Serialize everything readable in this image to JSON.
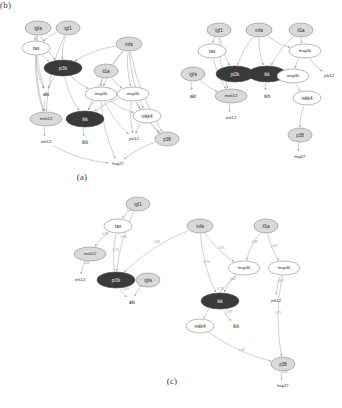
{
  "figure": {
    "kind": "signaling-network-figure",
    "panels": [
      {
        "id": "a",
        "caption": "(a)"
      },
      {
        "id": "b",
        "caption": "(b)"
      },
      {
        "id": "c",
        "caption": "(c)"
      }
    ]
  },
  "styles": {
    "stimulus_fill": "#d9d9d9",
    "dark_fill": "#3a3a3a",
    "dark_fill_alt": "#4d4d4d",
    "white_fill": "#ffffff",
    "stroke": "#8a8a8a",
    "edge": "#a8a8a8",
    "text_dark": "#2a2a2a",
    "text_light": "#f2f2f2"
  },
  "panel_a": {
    "caption": "(a)",
    "nodes": [
      {
        "id": "igfa",
        "label": "igfa",
        "x": 32,
        "y": 22,
        "rx": 13,
        "ry": 7,
        "shape": "ellipse",
        "fill": "stimulus",
        "text": "dark"
      },
      {
        "id": "igf1",
        "label": "igf1",
        "x": 62,
        "y": 22,
        "rx": 12,
        "ry": 7,
        "shape": "ellipse",
        "fill": "stimulus",
        "text": "dark"
      },
      {
        "id": "ras",
        "label": "ras",
        "x": 30,
        "y": 42,
        "rx": 14,
        "ry": 7,
        "shape": "ellipse",
        "fill": "white",
        "text": "dark"
      },
      {
        "id": "tnfa",
        "label": "tnfa",
        "x": 123,
        "y": 38,
        "rx": 13,
        "ry": 7,
        "shape": "ellipse",
        "fill": "stimulus",
        "text": "dark"
      },
      {
        "id": "pi3k",
        "label": "pi3k",
        "x": 57,
        "y": 62,
        "rx": 19,
        "ry": 8,
        "shape": "ellipse",
        "fill": "dark",
        "text": "light"
      },
      {
        "id": "il1a",
        "label": "il1a",
        "x": 100,
        "y": 65,
        "rx": 12,
        "ry": 7,
        "shape": "ellipse",
        "fill": "stimulus",
        "text": "dark"
      },
      {
        "id": "akt",
        "label": "akt",
        "x": 40,
        "y": 88,
        "rx": 0,
        "ry": 0,
        "shape": "text",
        "fill": "none",
        "text": "dark"
      },
      {
        "id": "map3k1",
        "label": "map3k",
        "x": 95,
        "y": 88,
        "rx": 16,
        "ry": 7,
        "shape": "ellipse",
        "fill": "white",
        "text": "dark"
      },
      {
        "id": "map3k2",
        "label": "map3k",
        "x": 127,
        "y": 88,
        "rx": 16,
        "ry": 7,
        "shape": "ellipse",
        "fill": "white",
        "text": "dark"
      },
      {
        "id": "mek12",
        "label": "mek12",
        "x": 40,
        "y": 113,
        "rx": 16,
        "ry": 7,
        "shape": "ellipse",
        "fill": "stimulus",
        "text": "dark"
      },
      {
        "id": "ikk",
        "label": "ikk",
        "x": 79,
        "y": 113,
        "rx": 19,
        "ry": 8,
        "shape": "ellipse",
        "fill": "dark",
        "text": "light"
      },
      {
        "id": "mkk4",
        "label": "mkk4",
        "x": 141,
        "y": 110,
        "rx": 14,
        "ry": 7,
        "shape": "ellipse",
        "fill": "white",
        "text": "dark"
      },
      {
        "id": "erk12",
        "label": "erk12",
        "x": 40,
        "y": 136,
        "rx": 0,
        "ry": 0,
        "shape": "text",
        "fill": "none",
        "text": "dark"
      },
      {
        "id": "ikb",
        "label": "ikb",
        "x": 79,
        "y": 136,
        "rx": 0,
        "ry": 0,
        "shape": "text",
        "fill": "none",
        "text": "dark"
      },
      {
        "id": "jnk12",
        "label": "jnk12",
        "x": 128,
        "y": 133,
        "rx": 0,
        "ry": 0,
        "shape": "text",
        "fill": "none",
        "text": "dark"
      },
      {
        "id": "p38",
        "label": "p38",
        "x": 161,
        "y": 133,
        "rx": 12,
        "ry": 7,
        "shape": "ellipse",
        "fill": "stimulus",
        "text": "dark"
      },
      {
        "id": "hsp27",
        "label": "hsp27",
        "x": 112,
        "y": 158,
        "rx": 0,
        "ry": 0,
        "shape": "text",
        "fill": "none",
        "text": "dark"
      }
    ],
    "edges": [
      {
        "from": "igfa",
        "to": "ras"
      },
      {
        "from": "igf1",
        "to": "ras"
      },
      {
        "from": "igfa",
        "to": "pi3k"
      },
      {
        "from": "igf1",
        "to": "pi3k"
      },
      {
        "from": "ras",
        "to": "pi3k"
      },
      {
        "from": "ras",
        "to": "mek12"
      },
      {
        "from": "ras",
        "to": "akt"
      },
      {
        "from": "igfa",
        "to": "akt"
      },
      {
        "from": "igfa",
        "to": "mek12"
      },
      {
        "from": "igf1",
        "to": "mek12"
      },
      {
        "from": "tnfa",
        "to": "pi3k"
      },
      {
        "from": "tnfa",
        "to": "map3k1"
      },
      {
        "from": "tnfa",
        "to": "map3k2"
      },
      {
        "from": "tnfa",
        "to": "ikk"
      },
      {
        "from": "tnfa",
        "to": "mkk4"
      },
      {
        "from": "tnfa",
        "to": "p38"
      },
      {
        "from": "il1a",
        "to": "map3k1"
      },
      {
        "from": "il1a",
        "to": "map3k2"
      },
      {
        "from": "pi3k",
        "to": "akt"
      },
      {
        "from": "pi3k",
        "to": "ikk"
      },
      {
        "from": "pi3k",
        "to": "map3k1"
      },
      {
        "from": "akt",
        "to": "mek12"
      },
      {
        "from": "map3k1",
        "to": "ikk"
      },
      {
        "from": "map3k1",
        "to": "mkk4"
      },
      {
        "from": "map3k1",
        "to": "jnk12"
      },
      {
        "from": "map3k1",
        "to": "hsp27"
      },
      {
        "from": "map3k2",
        "to": "mkk4"
      },
      {
        "from": "map3k2",
        "to": "jnk12"
      },
      {
        "from": "map3k2",
        "to": "p38"
      },
      {
        "from": "map3k2",
        "to": "ikk"
      },
      {
        "from": "mkk4",
        "to": "jnk12"
      },
      {
        "from": "mkk4",
        "to": "p38"
      },
      {
        "from": "mek12",
        "to": "erk12"
      },
      {
        "from": "ikk",
        "to": "ikb"
      },
      {
        "from": "erk12",
        "to": "hsp27"
      },
      {
        "from": "p38",
        "to": "hsp27"
      }
    ]
  },
  "panel_b": {
    "caption": "(b)",
    "nodes": [
      {
        "id": "igf1",
        "label": "igf1",
        "x": 36,
        "y": 24,
        "rx": 12,
        "ry": 7,
        "shape": "ellipse",
        "fill": "stimulus",
        "text": "dark"
      },
      {
        "id": "tnfa",
        "label": "tnfa",
        "x": 76,
        "y": 24,
        "rx": 13,
        "ry": 7,
        "shape": "ellipse",
        "fill": "stimulus",
        "text": "dark"
      },
      {
        "id": "il1a",
        "label": "il1a",
        "x": 118,
        "y": 24,
        "rx": 12,
        "ry": 7,
        "shape": "ellipse",
        "fill": "stimulus",
        "text": "dark"
      },
      {
        "id": "ras",
        "label": "ras",
        "x": 29,
        "y": 45,
        "rx": 14,
        "ry": 7,
        "shape": "ellipse",
        "fill": "white",
        "text": "dark"
      },
      {
        "id": "map3k1",
        "label": "map3k",
        "x": 122,
        "y": 45,
        "rx": 16,
        "ry": 7,
        "shape": "ellipse",
        "fill": "white",
        "text": "dark"
      },
      {
        "id": "igfa",
        "label": "igfa",
        "x": 10,
        "y": 68,
        "rx": 12,
        "ry": 7,
        "shape": "ellipse",
        "fill": "stimulus",
        "text": "dark"
      },
      {
        "id": "pi3k",
        "label": "pi3k",
        "x": 52,
        "y": 68,
        "rx": 19,
        "ry": 8,
        "shape": "ellipse",
        "fill": "dark",
        "text": "light"
      },
      {
        "id": "ikk",
        "label": "ikk",
        "x": 84,
        "y": 68,
        "rx": 19,
        "ry": 8,
        "shape": "ellipse",
        "fill": "dark",
        "text": "light"
      },
      {
        "id": "map3k2",
        "label": "map3k",
        "x": 110,
        "y": 70,
        "rx": 16,
        "ry": 7,
        "shape": "ellipse",
        "fill": "white",
        "text": "dark"
      },
      {
        "id": "jnk12",
        "label": "jnk12",
        "x": 146,
        "y": 70,
        "rx": 0,
        "ry": 0,
        "shape": "text",
        "fill": "none",
        "text": "dark"
      },
      {
        "id": "akt",
        "label": "akt",
        "x": 10,
        "y": 90,
        "rx": 0,
        "ry": 0,
        "shape": "text",
        "fill": "none",
        "text": "dark"
      },
      {
        "id": "mek12",
        "label": "mek12",
        "x": 48,
        "y": 90,
        "rx": 16,
        "ry": 7,
        "shape": "ellipse",
        "fill": "stimulus",
        "text": "dark"
      },
      {
        "id": "ikb",
        "label": "ikb",
        "x": 84,
        "y": 90,
        "rx": 0,
        "ry": 0,
        "shape": "text",
        "fill": "none",
        "text": "dark"
      },
      {
        "id": "mkk4",
        "label": "mkk4",
        "x": 124,
        "y": 92,
        "rx": 14,
        "ry": 7,
        "shape": "ellipse",
        "fill": "white",
        "text": "dark"
      },
      {
        "id": "erk12",
        "label": "erk12",
        "x": 48,
        "y": 112,
        "rx": 0,
        "ry": 0,
        "shape": "text",
        "fill": "none",
        "text": "dark"
      },
      {
        "id": "p38",
        "label": "p38",
        "x": 117,
        "y": 129,
        "rx": 12,
        "ry": 7,
        "shape": "ellipse",
        "fill": "stimulus",
        "text": "dark"
      },
      {
        "id": "hsp27",
        "label": "hsp27",
        "x": 117,
        "y": 151,
        "rx": 0,
        "ry": 0,
        "shape": "text",
        "fill": "none",
        "text": "dark"
      }
    ],
    "edges": [
      {
        "from": "igf1",
        "to": "ras"
      },
      {
        "from": "igf1",
        "to": "pi3k"
      },
      {
        "from": "igf1",
        "to": "mek12"
      },
      {
        "from": "ras",
        "to": "mek12"
      },
      {
        "from": "tnfa",
        "to": "pi3k"
      },
      {
        "from": "tnfa",
        "to": "ikk"
      },
      {
        "from": "tnfa",
        "to": "map3k1"
      },
      {
        "from": "il1a",
        "to": "map3k1"
      },
      {
        "from": "il1a",
        "to": "ikk"
      },
      {
        "from": "igfa",
        "to": "akt"
      },
      {
        "from": "igfa",
        "to": "mek12"
      },
      {
        "from": "map3k1",
        "to": "map3k2"
      },
      {
        "from": "map3k1",
        "to": "jnk12"
      },
      {
        "from": "map3k2",
        "to": "mkk4"
      },
      {
        "from": "ikk",
        "to": "ikb"
      },
      {
        "from": "mek12",
        "to": "erk12"
      },
      {
        "from": "mkk4",
        "to": "p38"
      },
      {
        "from": "p38",
        "to": "hsp27"
      }
    ]
  },
  "panel_c": {
    "caption": "(c)",
    "nodes": [
      {
        "id": "igf1",
        "label": "igf1",
        "x": 90,
        "y": 8,
        "rx": 12,
        "ry": 7,
        "shape": "ellipse",
        "fill": "stimulus",
        "text": "dark"
      },
      {
        "id": "ras",
        "label": "ras",
        "x": 70,
        "y": 30,
        "rx": 14,
        "ry": 7,
        "shape": "ellipse",
        "fill": "white",
        "text": "dark"
      },
      {
        "id": "tnfa",
        "label": "tnfa",
        "x": 152,
        "y": 30,
        "rx": 13,
        "ry": 7,
        "shape": "ellipse",
        "fill": "stimulus",
        "text": "dark"
      },
      {
        "id": "il1a",
        "label": "il1a",
        "x": 218,
        "y": 30,
        "rx": 12,
        "ry": 7,
        "shape": "ellipse",
        "fill": "stimulus",
        "text": "dark"
      },
      {
        "id": "mek12",
        "label": "mek12",
        "x": 42,
        "y": 58,
        "rx": 16,
        "ry": 7,
        "shape": "ellipse",
        "fill": "stimulus",
        "text": "dark"
      },
      {
        "id": "map3k1",
        "label": "map3k",
        "x": 196,
        "y": 72,
        "rx": 16,
        "ry": 7,
        "shape": "ellipse",
        "fill": "white",
        "text": "dark"
      },
      {
        "id": "map3k2",
        "label": "map3k",
        "x": 236,
        "y": 72,
        "rx": 16,
        "ry": 7,
        "shape": "ellipse",
        "fill": "white",
        "text": "dark"
      },
      {
        "id": "erk12",
        "label": "erk12",
        "x": 32,
        "y": 84,
        "rx": 0,
        "ry": 0,
        "shape": "text",
        "fill": "none",
        "text": "dark"
      },
      {
        "id": "pi3k",
        "label": "pi3k",
        "x": 68,
        "y": 84,
        "rx": 19,
        "ry": 8,
        "shape": "ellipse",
        "fill": "dark",
        "text": "light"
      },
      {
        "id": "igfa",
        "label": "igfa",
        "x": 100,
        "y": 84,
        "rx": 12,
        "ry": 7,
        "shape": "ellipse",
        "fill": "stimulus",
        "text": "dark"
      },
      {
        "id": "ikk",
        "label": "ikk",
        "x": 172,
        "y": 105,
        "rx": 19,
        "ry": 8,
        "shape": "ellipse",
        "fill": "dark",
        "text": "light"
      },
      {
        "id": "jnk12",
        "label": "jnk12",
        "x": 228,
        "y": 105,
        "rx": 0,
        "ry": 0,
        "shape": "text",
        "fill": "none",
        "text": "dark"
      },
      {
        "id": "akt",
        "label": "akt",
        "x": 84,
        "y": 106,
        "rx": 0,
        "ry": 0,
        "shape": "text",
        "fill": "none",
        "text": "dark"
      },
      {
        "id": "mkk4",
        "label": "mkk4",
        "x": 152,
        "y": 130,
        "rx": 14,
        "ry": 7,
        "shape": "ellipse",
        "fill": "white",
        "text": "dark"
      },
      {
        "id": "ikb",
        "label": "ikb",
        "x": 188,
        "y": 130,
        "rx": 0,
        "ry": 0,
        "shape": "text",
        "fill": "none",
        "text": "dark"
      },
      {
        "id": "p38",
        "label": "p38",
        "x": 235,
        "y": 168,
        "rx": 12,
        "ry": 7,
        "shape": "ellipse",
        "fill": "stimulus",
        "text": "dark"
      },
      {
        "id": "hsp27",
        "label": "hsp27",
        "x": 235,
        "y": 190,
        "rx": 0,
        "ry": 0,
        "shape": "text",
        "fill": "none",
        "text": "dark"
      }
    ],
    "edges": [
      {
        "from": "igf1",
        "to": "ras",
        "label": "1.00"
      },
      {
        "from": "igf1",
        "to": "pi3k",
        "label": "0.98"
      },
      {
        "from": "ras",
        "to": "mek12",
        "label": "0.96"
      },
      {
        "from": "ras",
        "to": "pi3k",
        "label": "0.72"
      },
      {
        "from": "tnfa",
        "to": "pi3k",
        "label": "0.88"
      },
      {
        "from": "tnfa",
        "to": "ikk",
        "label": "0.94"
      },
      {
        "from": "tnfa",
        "to": "map3k1",
        "label": "0.91"
      },
      {
        "from": "il1a",
        "to": "map3k1",
        "label": "0.99"
      },
      {
        "from": "il1a",
        "to": "map3k2",
        "label": "0.87"
      },
      {
        "from": "map3k1",
        "to": "ikk",
        "label": "0.64"
      },
      {
        "from": "map3k1",
        "to": "mkk4",
        "label": "0.78"
      },
      {
        "from": "map3k2",
        "to": "jnk12",
        "label": "0.83"
      },
      {
        "from": "map3k2",
        "to": "p38",
        "label": "0.71"
      },
      {
        "from": "mek12",
        "to": "erk12",
        "label": "1.00"
      },
      {
        "from": "pi3k",
        "to": "akt",
        "label": "0.93"
      },
      {
        "from": "igfa",
        "to": "akt",
        "label": "0.85"
      },
      {
        "from": "ikk",
        "to": "ikb",
        "label": "0.97"
      },
      {
        "from": "mkk4",
        "to": "p38",
        "label": "0.69"
      },
      {
        "from": "p38",
        "to": "hsp27",
        "label": "1.00"
      }
    ]
  }
}
